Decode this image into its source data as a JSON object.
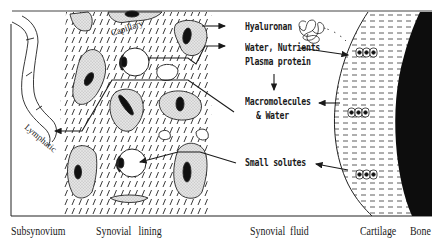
{
  "diagram": {
    "regions": {
      "subsynovium": "Subsynovium",
      "synovial_lining": "Synovial   lining",
      "synovial_fluid": "Synovial  fluid",
      "cartilage": "Cartilage",
      "bone": "Bone"
    },
    "structures": {
      "capillary": "Capillary",
      "lymphatic": "Lymphatic"
    },
    "labels": {
      "hyaluronan": "Hyaluronan",
      "water_nutrients": "Water, Nutrients",
      "plasma_protein": "Plasma protein",
      "macromolecules": "Macromolecules",
      "and_water": "& Water",
      "small_solutes": "Small solutes"
    },
    "colors": {
      "ink": "#1a1a1a",
      "background": "#ffffff",
      "bone": "#0d0d0d",
      "cell_fill": "#dcdcdc"
    }
  }
}
